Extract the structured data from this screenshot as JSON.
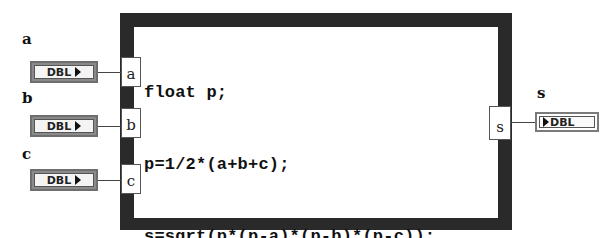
{
  "formula_node": {
    "code_lines": [
      "float p;",
      "p=1/2*(a+b+c);",
      "s=sqrt(p*(p-a)*(p-b)*(p-c));"
    ],
    "frame_color": "#2a2a2a"
  },
  "inputs": [
    {
      "label": "a",
      "terminal": "a",
      "type": "DBL"
    },
    {
      "label": "b",
      "terminal": "b",
      "type": "DBL"
    },
    {
      "label": "c",
      "terminal": "c",
      "type": "DBL"
    }
  ],
  "outputs": [
    {
      "label": "s",
      "terminal": "s",
      "type": "DBL"
    }
  ]
}
